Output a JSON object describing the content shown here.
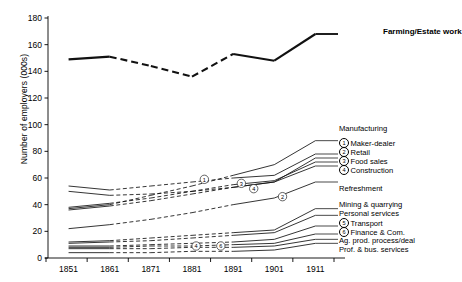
{
  "chart_data": {
    "type": "line",
    "title": "",
    "xlabel": "",
    "ylabel": "Number of employers (000s)",
    "x": [
      1851,
      1861,
      1871,
      1881,
      1891,
      1901,
      1911
    ],
    "xtick_labels": [
      "1851",
      "1861",
      "1871",
      "1881",
      "1891",
      "1901",
      "1911"
    ],
    "xlim": [
      1846,
      1916
    ],
    "ylim": [
      0,
      180
    ],
    "ytick_labels": [
      "0",
      "20",
      "40",
      "60",
      "80",
      "100",
      "120",
      "140",
      "160",
      "180"
    ],
    "ytick_values": [
      0,
      20,
      40,
      60,
      80,
      100,
      120,
      140,
      160,
      180
    ],
    "grid": false,
    "legend_position": "right-inline-labels",
    "note": "Dashed segments between 1861 and 1891 indicate interpolated/estimated values",
    "series": [
      {
        "name": "Farming/Estate work",
        "marker": "",
        "emphasis": "bold",
        "values": [
          149,
          151,
          144,
          136,
          153,
          148,
          168
        ],
        "dashed_from": 1861,
        "dashed_to": 1891
      },
      {
        "name": "Manufacturing",
        "marker": "",
        "values": [
          37,
          40,
          47,
          54,
          62,
          70,
          88
        ],
        "dashed_from": 1861,
        "dashed_to": 1891
      },
      {
        "name": "Maker-dealer",
        "marker": "1",
        "values": [
          54,
          51,
          54,
          57,
          60,
          62,
          78
        ],
        "dashed_from": 1861,
        "dashed_to": 1891
      },
      {
        "name": "Retail",
        "marker": "2",
        "values": [
          50,
          47,
          48,
          50,
          53,
          57,
          75
        ],
        "dashed_from": 1861,
        "dashed_to": 1891
      },
      {
        "name": "Food sales",
        "marker": "3",
        "values": [
          38,
          41,
          45,
          50,
          55,
          58,
          72
        ],
        "dashed_from": 1861,
        "dashed_to": 1891
      },
      {
        "name": "Construction",
        "marker": "4",
        "values": [
          36,
          39,
          43,
          48,
          53,
          57,
          69
        ],
        "dashed_from": 1861,
        "dashed_to": 1891
      },
      {
        "name": "Refreshment",
        "marker": "",
        "values": [
          22,
          25,
          29,
          34,
          40,
          45,
          57
        ],
        "dashed_from": 1861,
        "dashed_to": 1891
      },
      {
        "name": "Mining & quarrying",
        "marker": "",
        "values": [
          12,
          13,
          15,
          17,
          19,
          21,
          37
        ],
        "dashed_from": 1861,
        "dashed_to": 1891
      },
      {
        "name": "Personal services",
        "marker": "",
        "values": [
          11,
          12,
          13,
          15,
          17,
          19,
          32
        ],
        "dashed_from": 1861,
        "dashed_to": 1891
      },
      {
        "name": "Transport",
        "marker": "5",
        "values": [
          9,
          9,
          10,
          11,
          12,
          14,
          24
        ],
        "dashed_from": 1861,
        "dashed_to": 1891
      },
      {
        "name": "Finance & Com.",
        "marker": "6",
        "values": [
          8,
          8,
          9,
          9,
          10,
          11,
          18
        ],
        "dashed_from": 1861,
        "dashed_to": 1891
      },
      {
        "name": "Ag. prod. process/deal",
        "marker": "",
        "values": [
          7,
          7,
          7,
          8,
          8,
          9,
          14
        ],
        "dashed_from": 1861,
        "dashed_to": 1891
      },
      {
        "name": "Prof. & bus. services",
        "marker": "",
        "values": [
          4,
          4,
          4,
          5,
          5,
          6,
          11
        ],
        "dashed_from": 1861,
        "dashed_to": 1891
      }
    ],
    "inline_markers": [
      {
        "label": "1",
        "x": 1884,
        "y": 59
      },
      {
        "label": "3",
        "x": 1893,
        "y": 56
      },
      {
        "label": "4",
        "x": 1896,
        "y": 52
      },
      {
        "label": "2",
        "x": 1903,
        "y": 46
      },
      {
        "label": "4",
        "x": 1882,
        "y": 9
      },
      {
        "label": "6",
        "x": 1888,
        "y": 9
      }
    ],
    "annotations": [
      {
        "text": "Farming/Estate work",
        "bold": true,
        "x": 383,
        "y": 32
      },
      {
        "text": "Manufacturing",
        "bold": false,
        "x": 339,
        "y": 129
      },
      {
        "text": "Maker-dealer",
        "bold": false,
        "marker": "1",
        "x": 339,
        "y": 143
      },
      {
        "text": "Retail",
        "bold": false,
        "marker": "2",
        "x": 339,
        "y": 152
      },
      {
        "text": "Food sales",
        "bold": false,
        "marker": "3",
        "x": 339,
        "y": 161
      },
      {
        "text": "Construction",
        "bold": false,
        "marker": "4",
        "x": 339,
        "y": 170
      },
      {
        "text": "Refreshment",
        "bold": false,
        "x": 339,
        "y": 189
      },
      {
        "text": "Mining & quarrying",
        "bold": false,
        "x": 339,
        "y": 205
      },
      {
        "text": "Personal services",
        "bold": false,
        "x": 339,
        "y": 214
      },
      {
        "text": "Transport",
        "bold": false,
        "marker": "5",
        "x": 339,
        "y": 223
      },
      {
        "text": "Finance & Com.",
        "bold": false,
        "marker": "6",
        "x": 339,
        "y": 232
      },
      {
        "text": "Ag. prod. process/deal",
        "bold": false,
        "x": 339,
        "y": 241
      },
      {
        "text": "Prof. & bus. services",
        "bold": false,
        "x": 339,
        "y": 250
      }
    ]
  }
}
